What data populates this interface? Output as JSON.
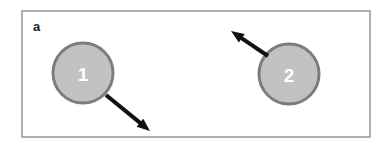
{
  "figure": {
    "panel_label": "a",
    "background_color": "#ffffff"
  },
  "frame": {
    "x": 22,
    "y": 11,
    "width": 348,
    "height": 126,
    "stroke_color": "#8c8c8c",
    "stroke_width": 1.4,
    "fill_color": "#ffffff"
  },
  "nodes": [
    {
      "label": "1",
      "cx": 83,
      "cy": 73,
      "r": 30,
      "fill_color": "#c2c2c2",
      "stroke_color": "#7d7d7d",
      "stroke_width": 3,
      "label_color": "#ffffff"
    },
    {
      "label": "2",
      "cx": 289,
      "cy": 74,
      "r": 30,
      "fill_color": "#c2c2c2",
      "stroke_color": "#7d7d7d",
      "stroke_width": 3,
      "label_color": "#ffffff"
    }
  ],
  "arrows": [
    {
      "name": "velocity-arrow-node-1",
      "direction": "down-right",
      "x1": 106,
      "y1": 95,
      "x2": 150,
      "y2": 131,
      "color": "#111111",
      "stroke_width": 4
    },
    {
      "name": "velocity-arrow-node-2",
      "direction": "up-left",
      "x1": 268,
      "y1": 56,
      "x2": 231,
      "y2": 31,
      "color": "#111111",
      "stroke_width": 4
    }
  ]
}
